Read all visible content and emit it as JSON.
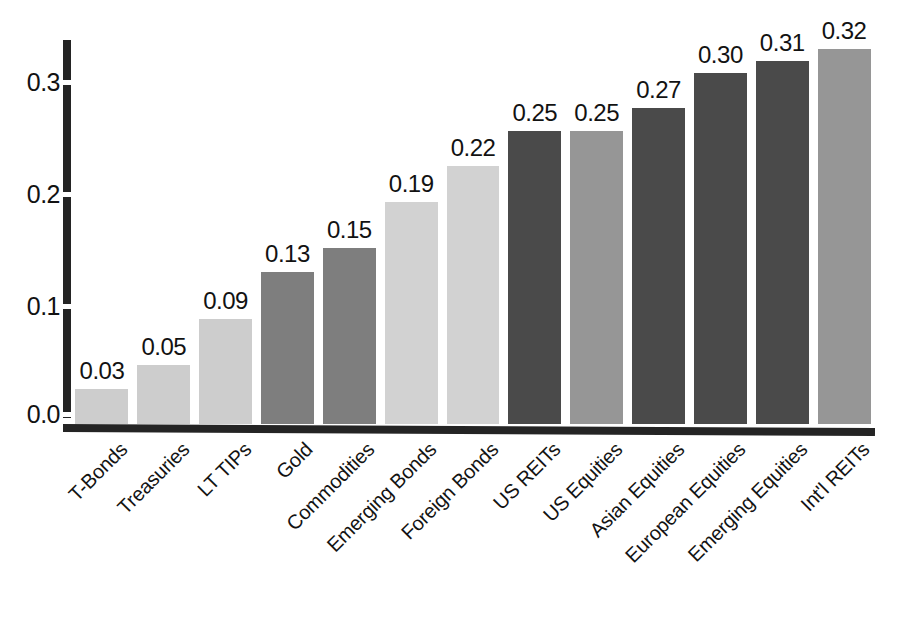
{
  "chart_data": {
    "type": "bar",
    "title": "",
    "subtitle": "",
    "xlabel": "",
    "ylabel": "",
    "ylim": [
      0.0,
      0.345
    ],
    "grid": false,
    "legend": "none",
    "orientation": "vertical",
    "value_labels_shown": true,
    "xtick_rotation": -45,
    "yticks": [
      "0.0",
      "0.1",
      "0.2",
      "0.3"
    ],
    "ytick_values": [
      0.0,
      0.1,
      0.2,
      0.3
    ],
    "categories": [
      "T-Bonds",
      "Treasuries",
      "LT TIPs",
      "Gold",
      "Commodities",
      "Emerging Bonds",
      "Foreign Bonds",
      "US REITs",
      "US Equities",
      "Asian Equities",
      "European Equities",
      "Emerging Equities",
      "Int'l REITs"
    ],
    "values": [
      0.03,
      0.05,
      0.09,
      0.13,
      0.15,
      0.19,
      0.22,
      0.25,
      0.25,
      0.27,
      0.3,
      0.31,
      0.32
    ],
    "value_labels": [
      "0.03",
      "0.05",
      "0.09",
      "0.13",
      "0.15",
      "0.19",
      "0.22",
      "0.25",
      "0.25",
      "0.27",
      "0.30",
      "0.31",
      "0.32"
    ],
    "bar_colors": [
      "#cdcdcd",
      "#cdcdcd",
      "#cdcdcd",
      "#7e7e7e",
      "#7e7e7e",
      "#d2d2d2",
      "#d2d2d2",
      "#4a4a4a",
      "#969696",
      "#4a4a4a",
      "#4a4a4a",
      "#4a4a4a",
      "#969696"
    ]
  },
  "axis": {
    "line_color": "#242424",
    "text_color": "#121212"
  }
}
